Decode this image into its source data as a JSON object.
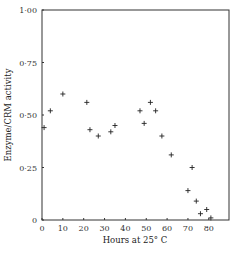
{
  "chart_data": {
    "type": "scatter",
    "title": "",
    "xlabel": "Hours at 25° C",
    "ylabel": "Enzyme/CRM activity",
    "xlim": [
      0,
      88
    ],
    "ylim": [
      0,
      1.0
    ],
    "x_ticks": [
      0,
      10,
      20,
      30,
      40,
      50,
      60,
      70,
      80
    ],
    "x_tick_labels": [
      "0",
      "10",
      "20",
      "30",
      "40",
      "50",
      "60",
      "70",
      "80"
    ],
    "y_ticks": [
      0,
      0.25,
      0.5,
      0.75,
      1.0
    ],
    "y_tick_labels": [
      "0",
      "0·25",
      "0·50",
      "0·75",
      "1·00"
    ],
    "grid": false,
    "legend": null,
    "marker": "+",
    "series": [
      {
        "name": "Enzyme/CRM activity",
        "points": [
          {
            "x": 1,
            "y": 0.44
          },
          {
            "x": 4,
            "y": 0.52
          },
          {
            "x": 10,
            "y": 0.6
          },
          {
            "x": 21.5,
            "y": 0.56
          },
          {
            "x": 23,
            "y": 0.43
          },
          {
            "x": 27,
            "y": 0.4
          },
          {
            "x": 33,
            "y": 0.42
          },
          {
            "x": 35,
            "y": 0.45
          },
          {
            "x": 47,
            "y": 0.52
          },
          {
            "x": 49,
            "y": 0.46
          },
          {
            "x": 52,
            "y": 0.56
          },
          {
            "x": 54.5,
            "y": 0.52
          },
          {
            "x": 57.5,
            "y": 0.4
          },
          {
            "x": 62,
            "y": 0.31
          },
          {
            "x": 70,
            "y": 0.14
          },
          {
            "x": 72,
            "y": 0.25
          },
          {
            "x": 74,
            "y": 0.09
          },
          {
            "x": 76,
            "y": 0.03
          },
          {
            "x": 79,
            "y": 0.05
          },
          {
            "x": 81,
            "y": 0.01
          }
        ]
      }
    ]
  },
  "style": {
    "axis_color": "#333333",
    "marker_color": "#222222"
  }
}
